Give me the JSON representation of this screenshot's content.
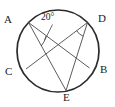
{
  "figure": {
    "type": "circle-with-inscribed-chords",
    "stroke_color": "#2b2b2b",
    "chord_color": "#4a4a4a",
    "label_color": "#1a1a1a",
    "background_color": "#ffffff",
    "circle": {
      "name": "circle",
      "cx": 58,
      "cy": 51,
      "r": 41,
      "stroke_width": 1.6
    },
    "points": [
      {
        "id": "A",
        "label": "A",
        "x": 28.5,
        "y": 22.5,
        "label_x": 4,
        "label_y": 14
      },
      {
        "id": "D",
        "label": "D",
        "x": 87.5,
        "y": 22.5,
        "label_x": 98,
        "label_y": 13
      },
      {
        "id": "B",
        "label": "B",
        "x": 89.5,
        "y": 68.0,
        "label_x": 100,
        "label_y": 64
      },
      {
        "id": "C",
        "label": "C",
        "x": 26.0,
        "y": 69.0,
        "label_x": 5,
        "label_y": 66
      },
      {
        "id": "E",
        "label": "E",
        "x": 66.0,
        "y": 90.5,
        "label_x": 63,
        "label_y": 92
      }
    ],
    "chords": [
      {
        "name": "chord-AB",
        "from": "A",
        "to": "B"
      },
      {
        "name": "chord-AE",
        "from": "A",
        "to": "E"
      },
      {
        "name": "chord-CD",
        "from": "C",
        "to": "D"
      },
      {
        "name": "chord-DE",
        "from": "D",
        "to": "E"
      }
    ],
    "angles": [
      {
        "id": "angle-A",
        "vertex": "A",
        "value": "20°",
        "label_x": 41,
        "label_y": 12,
        "leader": true
      },
      {
        "id": "angle-D",
        "vertex": "D",
        "value": "",
        "leader": false
      }
    ],
    "angle_label_text": "20°"
  }
}
